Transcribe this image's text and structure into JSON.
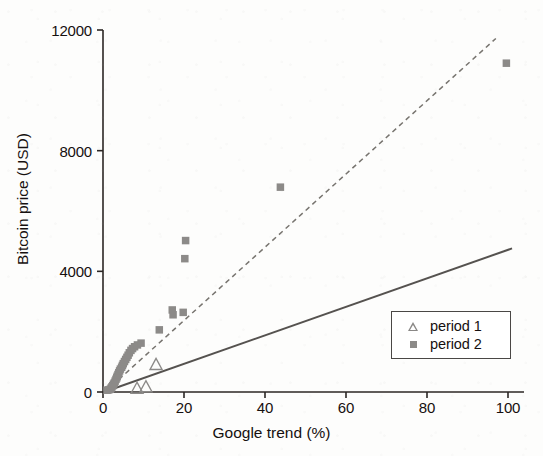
{
  "chart_data": {
    "type": "scatter",
    "title": "",
    "xlabel": "Google trend (%)",
    "ylabel": "Bitcoin price (USD)",
    "xlim": [
      0,
      103
    ],
    "ylim": [
      0,
      12400
    ],
    "xticks": [
      0,
      20,
      40,
      60,
      80,
      100
    ],
    "yticks": [
      0,
      4000,
      8000,
      12000
    ],
    "xtick_labels": [
      "0",
      "20",
      "40",
      "60",
      "80",
      "100"
    ],
    "ytick_labels": [
      "0",
      "4000",
      "8000",
      "12000"
    ],
    "grid": false,
    "legend_position": "lower right",
    "marker_color": "#8c8a88",
    "trend_color": "#55524f",
    "axis_color": "#2b2624",
    "series": [
      {
        "name": "period 1",
        "marker": "triangle",
        "color": "#8c8a88",
        "points": [
          [
            8.4,
            140
          ],
          [
            10.6,
            190
          ],
          [
            13.1,
            930
          ]
        ]
      },
      {
        "name": "period 2",
        "marker": "square",
        "color": "#8c8a88",
        "points": [
          [
            1.0,
            60
          ],
          [
            1.4,
            70
          ],
          [
            1.8,
            90
          ],
          [
            2.0,
            130
          ],
          [
            2.2,
            170
          ],
          [
            2.4,
            210
          ],
          [
            2.6,
            260
          ],
          [
            2.8,
            300
          ],
          [
            3.0,
            360
          ],
          [
            3.2,
            420
          ],
          [
            3.4,
            470
          ],
          [
            3.5,
            520
          ],
          [
            3.7,
            580
          ],
          [
            3.9,
            640
          ],
          [
            4.1,
            700
          ],
          [
            4.3,
            760
          ],
          [
            4.6,
            820
          ],
          [
            4.8,
            880
          ],
          [
            5.0,
            940
          ],
          [
            5.3,
            1010
          ],
          [
            5.6,
            1080
          ],
          [
            5.9,
            1150
          ],
          [
            6.2,
            1220
          ],
          [
            6.5,
            1300
          ],
          [
            6.9,
            1380
          ],
          [
            7.3,
            1440
          ],
          [
            7.8,
            1500
          ],
          [
            8.5,
            1560
          ],
          [
            9.4,
            1620
          ],
          [
            13.9,
            2060
          ],
          [
            17.1,
            2720
          ],
          [
            17.3,
            2560
          ],
          [
            19.8,
            2640
          ],
          [
            20.2,
            4420
          ],
          [
            20.4,
            5020
          ],
          [
            43.8,
            6790
          ],
          [
            99.6,
            10900
          ]
        ]
      }
    ],
    "trend_lines": [
      {
        "name": "period-1-fit",
        "style": "solid",
        "color": "#55524f",
        "x0": 0.6,
        "y0": 15,
        "x1": 101.0,
        "y1": 4760
      },
      {
        "name": "period-2-fit",
        "style": "dashed",
        "color": "#77746f",
        "x0": 0.6,
        "y0": 15,
        "x1": 97.0,
        "y1": 11720
      }
    ],
    "legend_entries": [
      {
        "label": "period 1",
        "marker": "triangle"
      },
      {
        "label": "period 2",
        "marker": "square"
      }
    ]
  }
}
